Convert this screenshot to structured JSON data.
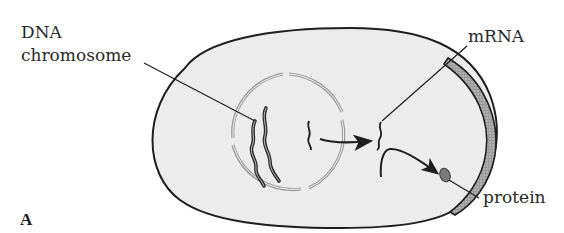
{
  "figure": {
    "panel_letter": "A",
    "labels": {
      "dna_line1": "DNA",
      "dna_line2": "chromosome",
      "mrna": "mRNA",
      "protein": "protein"
    },
    "colors": {
      "background": "#ffffff",
      "cytoplasm": "#ececec",
      "outline": "#1e1e1e",
      "nuclear_envelope": "#9a9a9a",
      "cell_wall": "#8c8c8c",
      "protein": "#7a7a7a"
    }
  }
}
